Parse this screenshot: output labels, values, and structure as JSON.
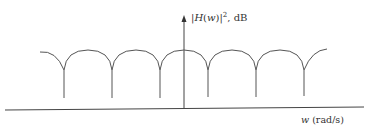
{
  "diagram": {
    "type": "frequency-response-sketch",
    "y_axis_label": {
      "prefix": "|",
      "func": "H",
      "open": "(",
      "var": "w",
      "close": ")|",
      "sup": "2",
      "suffix": ", dB"
    },
    "x_axis_label": {
      "var": "w",
      "units": " (rad/s)"
    },
    "colors": {
      "stroke": "#555555",
      "axis": "#444444",
      "background": "#ffffff"
    },
    "curve": {
      "description": "periodic scalloped response with cusps (nulls) between rounded lobes",
      "cusp_x": [
        64,
        112,
        160,
        208,
        256,
        304
      ],
      "lobe_count": 5,
      "partial_end_lobes": 2
    }
  }
}
